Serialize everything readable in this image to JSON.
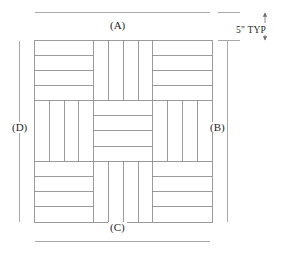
{
  "drawing": {
    "title": "Basketweave parquet pattern",
    "pattern_type": "3x3 basketweave",
    "stroke_color": "#8a8a8a",
    "dimension_line_color": "#a8a8a8",
    "text_color": "#1f1f1f",
    "background_color": "#ffffff"
  },
  "dimensions": {
    "top": {
      "label": "(A)",
      "name": "dimension-a"
    },
    "right": {
      "label": "(B)",
      "name": "dimension-b"
    },
    "bottom": {
      "label": "(C)",
      "name": "dimension-c"
    },
    "left": {
      "label": "(D)",
      "name": "dimension-d"
    },
    "typical": {
      "label": "5\" TYP",
      "value": 5,
      "unit": "inch",
      "note": "TYP"
    }
  },
  "pattern": {
    "rows": 3,
    "columns": 3,
    "strips_per_block": 4,
    "blocks": [
      {
        "row": 0,
        "col": 0,
        "orientation": "horizontal",
        "strips": 4
      },
      {
        "row": 0,
        "col": 1,
        "orientation": "vertical",
        "strips": 4
      },
      {
        "row": 0,
        "col": 2,
        "orientation": "horizontal",
        "strips": 4
      },
      {
        "row": 1,
        "col": 0,
        "orientation": "vertical",
        "strips": 4
      },
      {
        "row": 1,
        "col": 1,
        "orientation": "horizontal",
        "strips": 4
      },
      {
        "row": 1,
        "col": 2,
        "orientation": "vertical",
        "strips": 4
      },
      {
        "row": 2,
        "col": 0,
        "orientation": "horizontal",
        "strips": 4
      },
      {
        "row": 2,
        "col": 1,
        "orientation": "vertical",
        "strips": 4
      },
      {
        "row": 2,
        "col": 2,
        "orientation": "horizontal",
        "strips": 4
      }
    ]
  }
}
